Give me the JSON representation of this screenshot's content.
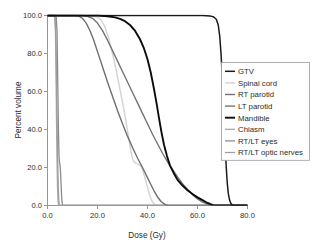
{
  "chart_data": {
    "type": "line",
    "title": "",
    "subtitle": "",
    "xlabel": "Dose (Gy)",
    "ylabel": "Percent volume",
    "xlim": [
      0.0,
      80.0
    ],
    "ylim": [
      0.0,
      100.0
    ],
    "xticks": [
      "0.0",
      "20.0",
      "40.0",
      "60.0",
      "80.0"
    ],
    "xtick_values": [
      0,
      20,
      40,
      60,
      80
    ],
    "yticks": [
      "0.0",
      "20.0",
      "40.0",
      "60.0",
      "80.0",
      "100.0"
    ],
    "ytick_values": [
      0,
      20,
      40,
      60,
      80,
      100
    ],
    "grid": false,
    "legend_position": "right-middle",
    "series": [
      {
        "name": "GTV",
        "color": "#1a1a1a",
        "width": 1.5,
        "points": [
          [
            0,
            100
          ],
          [
            10,
            100
          ],
          [
            20,
            100
          ],
          [
            30,
            100
          ],
          [
            40,
            100
          ],
          [
            50,
            100
          ],
          [
            58,
            100
          ],
          [
            62,
            100
          ],
          [
            65,
            99.8
          ],
          [
            66.5,
            99.2
          ],
          [
            67.5,
            98.0
          ],
          [
            68.3,
            95.0
          ],
          [
            68.9,
            89.0
          ],
          [
            69.4,
            80.0
          ],
          [
            69.9,
            68.0
          ],
          [
            70.3,
            55.0
          ],
          [
            70.7,
            42.0
          ],
          [
            71.1,
            30.0
          ],
          [
            71.5,
            20.0
          ],
          [
            71.9,
            12.0
          ],
          [
            72.3,
            6.5
          ],
          [
            72.8,
            3.0
          ],
          [
            73.3,
            1.2
          ],
          [
            73.9,
            0.3
          ],
          [
            74.5,
            0.0
          ],
          [
            80,
            0.0
          ]
        ]
      },
      {
        "name": "Spinal cord",
        "color": "#d5d5d5",
        "width": 1.5,
        "points": [
          [
            0,
            100
          ],
          [
            8,
            100
          ],
          [
            14,
            100
          ],
          [
            18,
            99.8
          ],
          [
            20,
            99.0
          ],
          [
            21.5,
            97.5
          ],
          [
            23,
            94.0
          ],
          [
            24.5,
            88.0
          ],
          [
            26,
            80.0
          ],
          [
            27.5,
            71.0
          ],
          [
            29,
            61.0
          ],
          [
            30.5,
            51.0
          ],
          [
            31.8,
            41.0
          ],
          [
            32.8,
            33.0
          ],
          [
            33.6,
            27.0
          ],
          [
            34.3,
            23.5
          ],
          [
            35.2,
            22.2
          ],
          [
            36.2,
            21.8
          ],
          [
            37.2,
            21.0
          ],
          [
            38.0,
            19.0
          ],
          [
            38.8,
            15.5
          ],
          [
            39.6,
            11.5
          ],
          [
            40.4,
            7.5
          ],
          [
            41.2,
            4.2
          ],
          [
            42.0,
            1.8
          ],
          [
            42.8,
            0.5
          ],
          [
            43.4,
            0.0
          ],
          [
            80,
            0.0
          ]
        ]
      },
      {
        "name": "RT parotid",
        "color": "#6f6f6f",
        "width": 1.4,
        "points": [
          [
            0,
            100
          ],
          [
            8,
            100
          ],
          [
            11,
            100
          ],
          [
            12.5,
            99.6
          ],
          [
            14,
            98.5
          ],
          [
            15.5,
            96.0
          ],
          [
            17,
            92.0
          ],
          [
            18.5,
            87.0
          ],
          [
            20,
            81.0
          ],
          [
            22,
            73.0
          ],
          [
            24,
            65.0
          ],
          [
            26,
            57.5
          ],
          [
            28,
            50.0
          ],
          [
            30,
            43.0
          ],
          [
            32,
            36.5
          ],
          [
            34,
            30.5
          ],
          [
            36,
            25.0
          ],
          [
            38,
            20.0
          ],
          [
            39.5,
            16.0
          ],
          [
            41,
            12.0
          ],
          [
            42.5,
            8.0
          ],
          [
            44,
            4.5
          ],
          [
            45.5,
            2.0
          ],
          [
            47,
            0.6
          ],
          [
            48,
            0.0
          ],
          [
            80,
            0.0
          ]
        ]
      },
      {
        "name": "LT parotid",
        "color": "#747474",
        "width": 1.4,
        "points": [
          [
            0,
            100
          ],
          [
            10,
            100
          ],
          [
            14,
            100
          ],
          [
            16,
            99.6
          ],
          [
            18,
            98.5
          ],
          [
            20,
            96.0
          ],
          [
            22,
            92.0
          ],
          [
            24,
            87.0
          ],
          [
            26,
            81.5
          ],
          [
            28,
            76.0
          ],
          [
            30,
            70.5
          ],
          [
            32,
            65.0
          ],
          [
            34,
            59.5
          ],
          [
            36,
            54.0
          ],
          [
            38,
            48.5
          ],
          [
            40,
            43.0
          ],
          [
            42,
            37.5
          ],
          [
            44,
            32.5
          ],
          [
            46,
            27.5
          ],
          [
            48,
            23.0
          ],
          [
            50,
            19.0
          ],
          [
            52,
            15.0
          ],
          [
            54,
            11.5
          ],
          [
            56,
            8.5
          ],
          [
            58,
            5.8
          ],
          [
            60,
            3.5
          ],
          [
            62,
            1.8
          ],
          [
            64,
            0.7
          ],
          [
            65.5,
            0.2
          ],
          [
            66.5,
            0.0
          ],
          [
            80,
            0.0
          ]
        ]
      },
      {
        "name": "Mandible",
        "color": "#0d0d0d",
        "width": 1.9,
        "points": [
          [
            0,
            100
          ],
          [
            14,
            100
          ],
          [
            20,
            100
          ],
          [
            24,
            99.6
          ],
          [
            27,
            99.0
          ],
          [
            29,
            98.2
          ],
          [
            31,
            97.0
          ],
          [
            33,
            95.0
          ],
          [
            35,
            92.0
          ],
          [
            37,
            87.5
          ],
          [
            38.5,
            83.0
          ],
          [
            40,
            77.0
          ],
          [
            41.3,
            70.0
          ],
          [
            42.5,
            62.0
          ],
          [
            43.6,
            54.0
          ],
          [
            44.6,
            46.0
          ],
          [
            45.6,
            38.5
          ],
          [
            46.6,
            32.0
          ],
          [
            47.8,
            26.0
          ],
          [
            49,
            21.0
          ],
          [
            50.5,
            17.0
          ],
          [
            52,
            13.5
          ],
          [
            54,
            10.5
          ],
          [
            56,
            8.0
          ],
          [
            58,
            6.0
          ],
          [
            60,
            4.3
          ],
          [
            62,
            2.8
          ],
          [
            63.5,
            1.7
          ],
          [
            65,
            0.8
          ],
          [
            66.2,
            0.2
          ],
          [
            67,
            0.0
          ],
          [
            80,
            0.0
          ]
        ]
      },
      {
        "name": "Chiasm",
        "color": "#a8a8a8",
        "width": 1.3,
        "points": [
          [
            0,
            100
          ],
          [
            2.2,
            100
          ],
          [
            2.9,
            99.0
          ],
          [
            3.2,
            90.0
          ],
          [
            3.4,
            70.0
          ],
          [
            3.6,
            45.0
          ],
          [
            3.8,
            25.0
          ],
          [
            4.0,
            10.0
          ],
          [
            4.2,
            3.0
          ],
          [
            4.4,
            0.0
          ],
          [
            80,
            0.0
          ]
        ]
      },
      {
        "name": "RT/LT eyes",
        "color": "#8c8c8c",
        "width": 1.3,
        "points": [
          [
            0,
            100
          ],
          [
            3.0,
            100
          ],
          [
            3.5,
            99.0
          ],
          [
            3.8,
            92.0
          ],
          [
            4.0,
            75.0
          ],
          [
            4.2,
            55.0
          ],
          [
            4.4,
            38.0
          ],
          [
            4.6,
            26.0
          ],
          [
            4.8,
            22.5
          ],
          [
            5.0,
            21.5
          ],
          [
            5.2,
            18.0
          ],
          [
            5.4,
            12.0
          ],
          [
            5.6,
            6.0
          ],
          [
            5.8,
            2.0
          ],
          [
            6.0,
            0.0
          ],
          [
            80,
            0.0
          ]
        ]
      },
      {
        "name": "RT/LT optic nerves",
        "color": "#9e9e9e",
        "width": 1.3,
        "points": [
          [
            0,
            100
          ],
          [
            2.6,
            100
          ],
          [
            3.0,
            99.0
          ],
          [
            3.3,
            93.0
          ],
          [
            3.5,
            78.0
          ],
          [
            3.7,
            58.0
          ],
          [
            3.9,
            38.0
          ],
          [
            4.1,
            22.0
          ],
          [
            4.3,
            10.0
          ],
          [
            4.5,
            3.5
          ],
          [
            4.7,
            0.0
          ],
          [
            80,
            0.0
          ]
        ]
      }
    ]
  },
  "legend": {
    "entries": [
      {
        "label": "GTV"
      },
      {
        "label": "Spinal cord"
      },
      {
        "label": "RT parotid"
      },
      {
        "label": "LT parotid"
      },
      {
        "label": "Mandible"
      },
      {
        "label": "Chiasm"
      },
      {
        "label": "RT/LT eyes"
      },
      {
        "label": "RT/LT optic nerves"
      }
    ]
  },
  "colors": {
    "axis": "#8a8a8a",
    "text": "#2b2b2b",
    "legend_border": "#9a9aa5",
    "background": "#ffffff"
  }
}
